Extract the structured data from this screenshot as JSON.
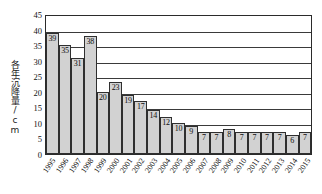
{
  "chart_data": {
    "type": "bar",
    "title": "",
    "xlabel": "",
    "ylabel": "各年沉降量/cm",
    "ylim": [
      0,
      45
    ],
    "ytick_step": 5,
    "yticks": [
      0,
      5,
      10,
      15,
      20,
      25,
      30,
      35,
      40,
      45
    ],
    "grid": true,
    "legend": "none",
    "categories": [
      "1995",
      "1996",
      "1997",
      "1998",
      "1999",
      "2000",
      "2001",
      "2002",
      "2003",
      "2004",
      "2005",
      "2006",
      "2007",
      "2008",
      "2009",
      "2010",
      "2011",
      "2012",
      "2013",
      "2014",
      "2015"
    ],
    "values": [
      39,
      35,
      31,
      38,
      20,
      23,
      19,
      17,
      14,
      12,
      10,
      9,
      7,
      7,
      8,
      7,
      7,
      7,
      7,
      6,
      7
    ],
    "bar_color": "#d2d2d2",
    "bar_border_color": "#2f2f2f",
    "axis_color": "#2b2b2b",
    "text_color": "#0d0d0d"
  }
}
